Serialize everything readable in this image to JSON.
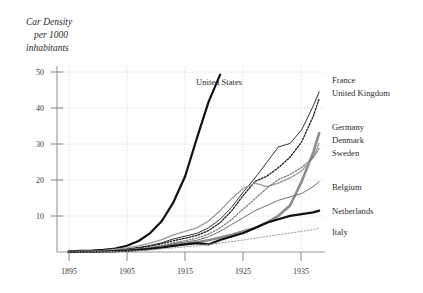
{
  "chart_data": {
    "type": "line",
    "title": "Car Density per 1000 inhabitants",
    "title_lines": [
      "Car Density",
      "per 1000",
      "inhabitants"
    ],
    "xlabel": "",
    "ylabel": "",
    "xlim": [
      1893,
      1939
    ],
    "ylim": [
      0,
      54
    ],
    "xticks": [
      1895,
      1905,
      1915,
      1925,
      1935
    ],
    "yticks": [
      10,
      20,
      30,
      40,
      50
    ],
    "grid": true,
    "legend_position": "right-inline",
    "x": [
      1895,
      1897,
      1899,
      1901,
      1903,
      1905,
      1907,
      1909,
      1911,
      1913,
      1915,
      1917,
      1919,
      1921,
      1923,
      1925,
      1927,
      1929,
      1931,
      1933,
      1935,
      1937,
      1938
    ],
    "series": [
      {
        "name": "United States",
        "label_position": "inline-top",
        "style": "solid-thick-black",
        "color": "#111111",
        "values": [
          0.2,
          0.3,
          0.4,
          0.6,
          1.0,
          1.8,
          3.2,
          5.5,
          9.0,
          14.5,
          22.0,
          33.0,
          43.5,
          51.5,
          null,
          null,
          null,
          null,
          null,
          null,
          null,
          null,
          null
        ]
      },
      {
        "name": "France",
        "label_position": "right",
        "style": "solid-thin-dark",
        "color": "#333333",
        "values": [
          0.1,
          0.2,
          0.3,
          0.4,
          0.6,
          0.9,
          1.3,
          1.9,
          2.7,
          3.8,
          4.6,
          5.4,
          7.0,
          9.5,
          13.0,
          17.5,
          21.5,
          26.0,
          30.5,
          31.5,
          35.5,
          42.5,
          46.5
        ]
      },
      {
        "name": "United Kingdom",
        "label_position": "right",
        "style": "dotted-black",
        "color": "#1a1a1a",
        "values": [
          0.1,
          0.15,
          0.2,
          0.3,
          0.5,
          0.8,
          1.2,
          1.7,
          2.4,
          3.3,
          4.0,
          4.8,
          6.2,
          8.5,
          12.0,
          16.5,
          20.5,
          22.0,
          24.5,
          27.5,
          32.0,
          39.5,
          44.5
        ]
      },
      {
        "name": "Germany",
        "label_position": "right",
        "style": "solid-thick-gray",
        "color": "#8c8c8c",
        "values": [
          0.05,
          0.1,
          0.15,
          0.2,
          0.3,
          0.5,
          0.7,
          1.0,
          1.4,
          2.0,
          2.4,
          2.8,
          3.4,
          4.2,
          5.0,
          6.0,
          7.0,
          8.5,
          10.5,
          13.5,
          20.5,
          29.0,
          34.5
        ]
      },
      {
        "name": "Denmark",
        "label_position": "right",
        "style": "solid-medium-gray",
        "color": "#9a9a9a",
        "values": [
          0.1,
          0.2,
          0.3,
          0.5,
          0.8,
          1.2,
          1.8,
          2.6,
          3.6,
          5.0,
          6.0,
          7.0,
          9.0,
          12.0,
          15.5,
          18.5,
          20.0,
          19.0,
          20.0,
          21.5,
          23.5,
          27.5,
          31.5
        ]
      },
      {
        "name": "Sweden",
        "label_position": "right",
        "style": "dotted-gray",
        "color": "#777777",
        "values": [
          0.05,
          0.1,
          0.15,
          0.25,
          0.4,
          0.6,
          0.9,
          1.3,
          1.9,
          2.7,
          3.3,
          4.0,
          5.2,
          7.0,
          9.5,
          12.5,
          15.5,
          18.5,
          21.0,
          22.5,
          24.5,
          27.5,
          30.0
        ]
      },
      {
        "name": "Belgium",
        "label_position": "right",
        "style": "solid-thin-gray",
        "color": "#6f6f6f",
        "values": [
          0.05,
          0.1,
          0.15,
          0.2,
          0.35,
          0.55,
          0.8,
          1.2,
          1.7,
          2.4,
          2.9,
          3.4,
          4.4,
          6.0,
          8.0,
          10.0,
          12.0,
          13.5,
          15.0,
          16.0,
          17.0,
          19.0,
          20.5
        ]
      },
      {
        "name": "Netherlands",
        "label_position": "right",
        "style": "solid-thick-black",
        "color": "#111111",
        "values": [
          0.05,
          0.08,
          0.1,
          0.15,
          0.25,
          0.4,
          0.6,
          0.9,
          1.3,
          1.8,
          2.2,
          2.6,
          2.2,
          3.5,
          4.5,
          5.5,
          7.0,
          8.5,
          9.5,
          10.5,
          11.0,
          11.5,
          12.0
        ]
      },
      {
        "name": "Italy",
        "label_position": "right",
        "style": "dotted-light",
        "color": "#9d9d9d",
        "values": [
          0.02,
          0.04,
          0.06,
          0.1,
          0.15,
          0.25,
          0.4,
          0.6,
          0.9,
          1.2,
          1.5,
          1.8,
          2.2,
          2.6,
          3.0,
          3.5,
          4.0,
          4.5,
          5.0,
          5.5,
          6.0,
          6.5,
          7.0
        ]
      }
    ]
  },
  "labels": {
    "united_states": "United States",
    "france": "France",
    "united_kingdom": "United Kingdom",
    "germany": "Germany",
    "denmark": "Denmark",
    "sweden": "Sweden",
    "belgium": "Belgium",
    "netherlands": "Netherlands",
    "italy": "Italy"
  },
  "axis": {
    "y_tick_10": "10",
    "y_tick_20": "20",
    "y_tick_30": "30",
    "y_tick_40": "40",
    "y_tick_50": "50",
    "x_tick_1895": "1895",
    "x_tick_1905": "1905",
    "x_tick_1915": "1915",
    "x_tick_1925": "1925",
    "x_tick_1935": "1935"
  },
  "title": {
    "line1": "Car Density",
    "line2": "per 1000",
    "line3": "inhabitants"
  },
  "colors": {
    "grid": "#cccccc",
    "axis": "#9a9a9a",
    "text": "#2b2b2b"
  }
}
